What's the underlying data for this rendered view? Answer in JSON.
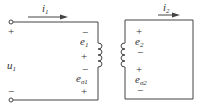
{
  "diagram": {
    "type": "transformer-circuit",
    "colors": {
      "wire": "#444444",
      "text": "#333333",
      "background": "#ffffff"
    },
    "primary": {
      "current": {
        "symbol": "i",
        "sub": "1"
      },
      "voltage": {
        "symbol": "u",
        "sub": "1"
      },
      "terminal_top_sign": "+",
      "terminal_bottom_sign": "−",
      "emf1": {
        "symbol": "e",
        "sub": "1",
        "top_sign": "−",
        "bottom_sign": "+"
      },
      "emf_leak": {
        "symbol": "e",
        "sub": "σ1",
        "top_sign": "−",
        "bottom_sign": "+"
      }
    },
    "secondary": {
      "current": {
        "symbol": "i",
        "sub": "2"
      },
      "emf2": {
        "symbol": "e",
        "sub": "2",
        "top_sign": "+",
        "bottom_sign": "−"
      },
      "emf_leak": {
        "symbol": "e",
        "sub": "σ2",
        "top_sign": "+",
        "bottom_sign": "−"
      }
    }
  }
}
